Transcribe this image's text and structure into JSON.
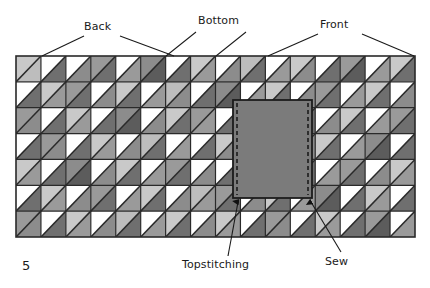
{
  "figure": {
    "page_number": "5",
    "type": "sewing-pattern-diagram",
    "panel": {
      "x": 16,
      "y": 56,
      "width": 399,
      "height": 181,
      "grid_columns": 16,
      "grid_rows": 7,
      "border_color": "#2a2a2a",
      "description": "Pieced quilt panel of half-square-triangle blocks"
    },
    "pocket": {
      "x": 233,
      "y": 100,
      "width": 79,
      "height": 98,
      "fill": "#7b7b7b",
      "border_color": "#1c1c1c",
      "stitch_color": "#1c1c1c",
      "stitch_style": "dashed"
    }
  },
  "labels": {
    "back": "Back",
    "bottom": "Bottom",
    "front": "Front",
    "topstitching": "Topstitching",
    "sew": "Sew"
  },
  "palette": {
    "white": "#ffffff",
    "light": "#c9c9c9",
    "light2": "#bdbdbd",
    "mid": "#9a9a9a",
    "mid2": "#8c8c8c",
    "dark": "#6f6f6f",
    "darker": "#5c5c5c",
    "line": "#2a2a2a",
    "leader": "#1a1a1a",
    "text": "#1a1a1a"
  },
  "chart_data": {
    "type": "heatmap",
    "xlabel": "",
    "ylabel": "",
    "columns": 16,
    "rows": 7,
    "legend": [
      "Back",
      "Bottom",
      "Front"
    ],
    "section_breaks_columns": [
      6,
      11
    ],
    "upper_triangle_shades": [
      [
        "#c9c9c9",
        "#ffffff",
        "#ffffff",
        "#9a9a9a",
        "#ffffff",
        "#8c8c8c",
        "#ffffff",
        "#c9c9c9",
        "#ffffff",
        "#bdbdbd",
        "#ffffff",
        "#c9c9c9",
        "#ffffff",
        "#9a9a9a",
        "#ffffff",
        "#c9c9c9"
      ],
      [
        "#ffffff",
        "#c9c9c9",
        "#9a9a9a",
        "#ffffff",
        "#c9c9c9",
        "#ffffff",
        "#bdbdbd",
        "#ffffff",
        "#8c8c8c",
        "#ffffff",
        "#c9c9c9",
        "#ffffff",
        "#9a9a9a",
        "#ffffff",
        "#c9c9c9",
        "#ffffff"
      ],
      [
        "#9a9a9a",
        "#ffffff",
        "#c9c9c9",
        "#ffffff",
        "#8c8c8c",
        "#ffffff",
        "#c9c9c9",
        "#9a9a9a",
        "#ffffff",
        "#c9c9c9",
        "#ffffff",
        "#bdbdbd",
        "#ffffff",
        "#c9c9c9",
        "#ffffff",
        "#9a9a9a"
      ],
      [
        "#ffffff",
        "#9a9a9a",
        "#ffffff",
        "#c9c9c9",
        "#ffffff",
        "#bdbdbd",
        "#ffffff",
        "#ffffff",
        "#c9c9c9",
        "#ffffff",
        "#9a9a9a",
        "#ffffff",
        "#c9c9c9",
        "#ffffff",
        "#8c8c8c",
        "#ffffff"
      ],
      [
        "#c9c9c9",
        "#ffffff",
        "#8c8c8c",
        "#ffffff",
        "#c9c9c9",
        "#ffffff",
        "#9a9a9a",
        "#ffffff",
        "#ffffff",
        "#8c8c8c",
        "#ffffff",
        "#c9c9c9",
        "#ffffff",
        "#9a9a9a",
        "#ffffff",
        "#c9c9c9"
      ],
      [
        "#ffffff",
        "#c9c9c9",
        "#ffffff",
        "#9a9a9a",
        "#ffffff",
        "#c9c9c9",
        "#ffffff",
        "#bdbdbd",
        "#9a9a9a",
        "#ffffff",
        "#c9c9c9",
        "#ffffff",
        "#8c8c8c",
        "#ffffff",
        "#c9c9c9",
        "#ffffff"
      ],
      [
        "#9a9a9a",
        "#ffffff",
        "#c9c9c9",
        "#ffffff",
        "#bdbdbd",
        "#ffffff",
        "#c9c9c9",
        "#ffffff",
        "#c9c9c9",
        "#ffffff",
        "#9a9a9a",
        "#ffffff",
        "#c9c9c9",
        "#ffffff",
        "#9a9a9a",
        "#ffffff"
      ]
    ],
    "lower_triangle_shades": [
      [
        "#bdbdbd",
        "#6f6f6f",
        "#8c8c8c",
        "#6f6f6f",
        "#9a9a9a",
        "#5c5c5c",
        "#6f6f6f",
        "#9a9a9a",
        "#8c8c8c",
        "#6f6f6f",
        "#9a9a9a",
        "#8c8c8c",
        "#6f6f6f",
        "#5c5c5c",
        "#9a9a9a",
        "#6f6f6f"
      ],
      [
        "#6f6f6f",
        "#9a9a9a",
        "#6f6f6f",
        "#8c8c8c",
        "#6f6f6f",
        "#9a9a9a",
        "#8c8c8c",
        "#6f6f6f",
        "#5c5c5c",
        "#9a9a9a",
        "#6f6f6f",
        "#8c8c8c",
        "#6f6f6f",
        "#9a9a9a",
        "#6f6f6f",
        "#8c8c8c"
      ],
      [
        "#8c8c8c",
        "#6f6f6f",
        "#9a9a9a",
        "#6f6f6f",
        "#5c5c5c",
        "#8c8c8c",
        "#6f6f6f",
        "#9a9a9a",
        "#6f6f6f",
        "#8c8c8c",
        "#9a9a9a",
        "#6f6f6f",
        "#8c8c8c",
        "#6f6f6f",
        "#9a9a9a",
        "#6f6f6f"
      ],
      [
        "#6f6f6f",
        "#8c8c8c",
        "#6f6f6f",
        "#9a9a9a",
        "#8c8c8c",
        "#6f6f6f",
        "#9a9a9a",
        "#6f6f6f",
        "#8c8c8c",
        "#6f6f6f",
        "#9a9a9a",
        "#8c8c8c",
        "#6f6f6f",
        "#9a9a9a",
        "#5c5c5c",
        "#6f6f6f"
      ],
      [
        "#9a9a9a",
        "#6f6f6f",
        "#5c5c5c",
        "#8c8c8c",
        "#6f6f6f",
        "#9a9a9a",
        "#6f6f6f",
        "#8c8c8c",
        "#6f6f6f",
        "#5c5c5c",
        "#8c8c8c",
        "#6f6f6f",
        "#9a9a9a",
        "#6f6f6f",
        "#8c8c8c",
        "#9a9a9a"
      ],
      [
        "#6f6f6f",
        "#9a9a9a",
        "#8c8c8c",
        "#6f6f6f",
        "#9a9a9a",
        "#6f6f6f",
        "#8c8c8c",
        "#9a9a9a",
        "#6f6f6f",
        "#8c8c8c",
        "#6f6f6f",
        "#9a9a9a",
        "#5c5c5c",
        "#6f6f6f",
        "#9a9a9a",
        "#6f6f6f"
      ],
      [
        "#8c8c8c",
        "#6f6f6f",
        "#9a9a9a",
        "#8c8c8c",
        "#6f6f6f",
        "#9a9a9a",
        "#6f6f6f",
        "#8c8c8c",
        "#9a9a9a",
        "#6f6f6f",
        "#8c8c8c",
        "#6f6f6f",
        "#9a9a9a",
        "#6f6f6f",
        "#5c5c5c",
        "#9a9a9a"
      ]
    ]
  },
  "leaders": {
    "back": [
      [
        [
          "84,34"
        ],
        [
          "42,56"
        ]
      ],
      [
        [
          "118,34"
        ],
        [
          "174,56"
        ]
      ]
    ],
    "bottom": [
      [
        [
          "196,30"
        ],
        [
          "166,56"
        ]
      ],
      [
        [
          "244,30"
        ],
        [
          "214,56"
        ]
      ]
    ],
    "front": [
      [
        [
          "318,32"
        ],
        [
          "268,56"
        ]
      ],
      [
        [
          "360,32"
        ],
        [
          "414,56"
        ]
      ]
    ],
    "topstitching": [
      [
        "230,256"
      ],
      [
        "237,200"
      ]
    ],
    "sew": [
      [
        "340,252"
      ],
      [
        "312,200"
      ]
    ]
  }
}
